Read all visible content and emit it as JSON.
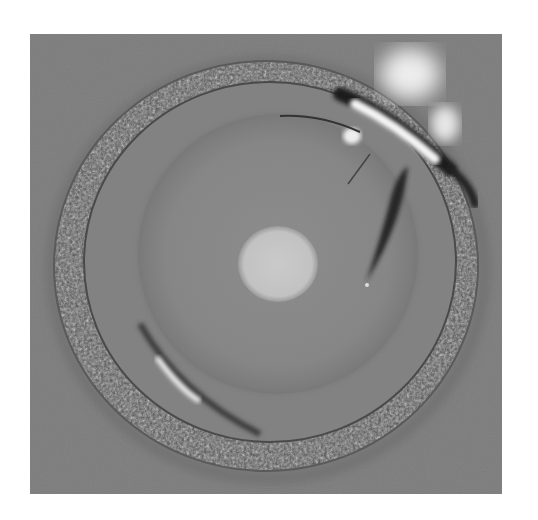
{
  "image": {
    "description": "Grayscale microscope photograph of a circular specimen with a granular outer ring, smooth inner disk and bright central spot",
    "colors": {
      "background": "#7c7c7c",
      "page": "#ffffff",
      "ring_dark": "#3c3c3c",
      "ring_light": "#8a8a8a",
      "inner_disk": "#888888",
      "center_spot": "#c4c4c4",
      "highlight": "#f4f4f4",
      "streak": "#2a2a2a"
    },
    "features": [
      {
        "name": "outer-granular-ring"
      },
      {
        "name": "inner-smooth-disk"
      },
      {
        "name": "central-bright-spot"
      },
      {
        "name": "top-right-bright-highlight"
      },
      {
        "name": "dark-blade-streak"
      },
      {
        "name": "lower-left-reflection"
      }
    ]
  }
}
